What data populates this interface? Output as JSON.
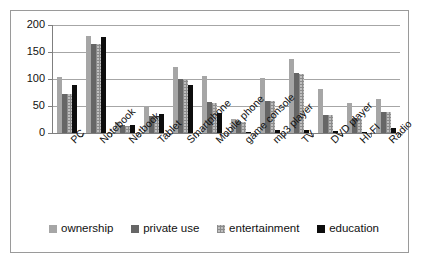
{
  "chart_data": {
    "type": "bar",
    "title": "",
    "subtitle": "",
    "xlabel": "",
    "ylabel": "",
    "ylim": [
      0,
      200
    ],
    "yticks": [
      0,
      50,
      100,
      150,
      200
    ],
    "grid": true,
    "legend_position": "bottom",
    "categories": [
      "PC",
      "Notebook",
      "Netbook",
      "Tablet",
      "Smartphone",
      "Mobile phone",
      "game console",
      "mp3 player",
      "TV",
      "DVD player",
      "HI-FI",
      "Radio"
    ],
    "series": [
      {
        "name": "ownership",
        "color": "#a6a6a6",
        "values": [
          104,
          179,
          21,
          49,
          123,
          106,
          26,
          101,
          137,
          81,
          55,
          63
        ]
      },
      {
        "name": "private use",
        "color": "#666666",
        "values": [
          73,
          165,
          14,
          32,
          100,
          57,
          22,
          60,
          111,
          34,
          27,
          39
        ]
      },
      {
        "name": "entertainment",
        "color": "#bfbfbf",
        "values": [
          72,
          164,
          13,
          32,
          99,
          56,
          21,
          59,
          110,
          33,
          26,
          38
        ]
      },
      {
        "name": "education",
        "color": "#0d0d0d",
        "values": [
          88,
          177,
          15,
          35,
          89,
          37,
          1,
          5,
          6,
          3,
          2,
          9
        ]
      }
    ]
  },
  "legend": {
    "items": [
      {
        "label": "ownership"
      },
      {
        "label": "private use"
      },
      {
        "label": "entertainment"
      },
      {
        "label": "education"
      }
    ]
  }
}
